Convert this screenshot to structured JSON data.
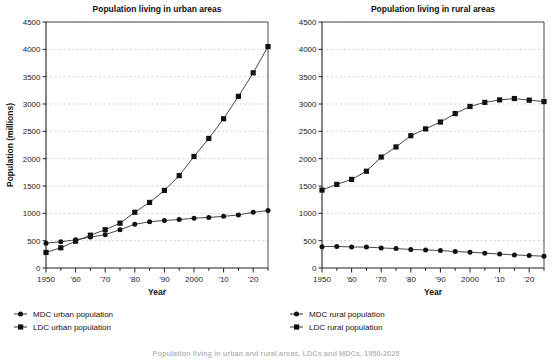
{
  "figure": {
    "caption": "Population living in urban and rural areas, LDCs and MDCs, 1950-2025"
  },
  "chart_data": [
    {
      "type": "line",
      "title": "Population living in urban areas",
      "xlabel": "Year",
      "ylabel": "Population (millions)",
      "xlim": [
        1950,
        2025
      ],
      "ylim": [
        0,
        4500
      ],
      "ytick_step": 500,
      "xtick_major_step": 10,
      "xtick_minor_step": 5,
      "grid": true,
      "legend_position": "below-left",
      "yticks": [
        0,
        500,
        1000,
        1500,
        2000,
        2500,
        3000,
        3500,
        4000,
        4500
      ],
      "ytick_labels": [
        "0",
        "500",
        "1000",
        "1500",
        "2000",
        "2500",
        "3000",
        "3500",
        "4000",
        "4500"
      ],
      "xticks": [
        1950,
        1960,
        1970,
        1980,
        1990,
        2000,
        2010,
        2020
      ],
      "xtick_labels": [
        "1950",
        "'60",
        "'70",
        "'80",
        "'90",
        "2000",
        "'10",
        "'20"
      ],
      "x": [
        1950,
        1955,
        1960,
        1965,
        1970,
        1975,
        1980,
        1985,
        1990,
        1995,
        2000,
        2005,
        2010,
        2015,
        2020,
        2025
      ],
      "series": [
        {
          "name": "MDC urban population",
          "marker": "circle",
          "values": [
            455,
            480,
            515,
            565,
            610,
            700,
            800,
            845,
            870,
            885,
            910,
            925,
            945,
            970,
            1020,
            1050
          ]
        },
        {
          "name": "LDC urban population",
          "marker": "square",
          "values": [
            285,
            370,
            490,
            600,
            700,
            820,
            1020,
            1200,
            1420,
            1690,
            2040,
            2370,
            2730,
            3140,
            3570,
            4050
          ]
        }
      ]
    },
    {
      "type": "line",
      "title": "Population living in rural areas",
      "xlabel": "Year",
      "ylabel": "",
      "xlim": [
        1950,
        2025
      ],
      "ylim": [
        0,
        4500
      ],
      "ytick_step": 500,
      "xtick_major_step": 10,
      "xtick_minor_step": 5,
      "grid": true,
      "legend_position": "below-left",
      "yticks": [
        0,
        500,
        1000,
        1500,
        2000,
        2500,
        3000,
        3500,
        4000,
        4500
      ],
      "ytick_labels": [
        "0",
        "500",
        "1000",
        "1500",
        "2000",
        "2500",
        "3000",
        "3500",
        "4000",
        "4500"
      ],
      "xticks": [
        1950,
        1960,
        1970,
        1980,
        1990,
        2000,
        2010,
        2020
      ],
      "xtick_labels": [
        "1950",
        "'60",
        "'70",
        "'80",
        "'90",
        "2000",
        "'10",
        "'20"
      ],
      "x": [
        1950,
        1955,
        1960,
        1965,
        1970,
        1975,
        1980,
        1985,
        1990,
        1995,
        2000,
        2005,
        2010,
        2015,
        2020,
        2025
      ],
      "series": [
        {
          "name": "MDC rural population",
          "marker": "circle",
          "values": [
            390,
            395,
            385,
            382,
            368,
            355,
            340,
            330,
            320,
            300,
            290,
            272,
            255,
            240,
            228,
            215
          ]
        },
        {
          "name": "LDC rural population",
          "marker": "square",
          "values": [
            1425,
            1530,
            1620,
            1770,
            2030,
            2215,
            2420,
            2545,
            2670,
            2825,
            2955,
            3030,
            3075,
            3100,
            3070,
            3045
          ]
        }
      ]
    }
  ]
}
